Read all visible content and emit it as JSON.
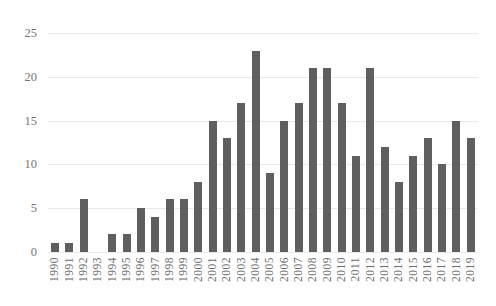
{
  "chart_data": {
    "type": "bar",
    "title": "",
    "xlabel": "",
    "ylabel": "",
    "categories": [
      "1990",
      "1991",
      "1992",
      "1993",
      "1994",
      "1995",
      "1996",
      "1997",
      "1998",
      "1999",
      "2000",
      "2001",
      "2002",
      "2003",
      "2004",
      "2005",
      "2006",
      "2007",
      "2008",
      "2009",
      "2010",
      "2011",
      "2012",
      "2013",
      "2014",
      "2015",
      "2016",
      "2017",
      "2018",
      "2019"
    ],
    "values": [
      1,
      1,
      6,
      0,
      2,
      2,
      5,
      4,
      6,
      6,
      8,
      15,
      13,
      17,
      23,
      9,
      15,
      17,
      21,
      21,
      17,
      11,
      21,
      12,
      8,
      11,
      13,
      10,
      15,
      13
    ],
    "y_ticks": [
      0,
      5,
      10,
      15,
      20,
      25
    ],
    "ylim": [
      0,
      25
    ],
    "grid": "horizontal",
    "legend_position": "none",
    "colors": {
      "bar": "#5f5f5f",
      "gridline": "#e8e8e8",
      "y_tick_label": "#757575",
      "x_tick_label": "#6e6e6e",
      "background": "#fefefe"
    }
  }
}
